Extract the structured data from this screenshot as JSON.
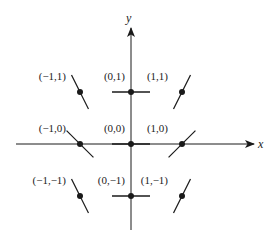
{
  "figure": {
    "colors": {
      "ink": "#1a1a1a",
      "background": "#ffffff"
    },
    "axes": {
      "x_label": "x",
      "y_label": "y",
      "origin_px": [
        131,
        144
      ],
      "unit_px": [
        51,
        52
      ]
    },
    "points": [
      {
        "label": "(−1,1)",
        "x": -1,
        "y": 1,
        "slope": -2
      },
      {
        "label": "(0,1)",
        "x": 0,
        "y": 1,
        "slope": 0
      },
      {
        "label": "(1,1)",
        "x": 1,
        "y": 1,
        "slope": 2
      },
      {
        "label": "(−1,0)",
        "x": -1,
        "y": 0,
        "slope": -1
      },
      {
        "label": "(0,0)",
        "x": 0,
        "y": 0,
        "slope": 0
      },
      {
        "label": "(1,0)",
        "x": 1,
        "y": 0,
        "slope": 1
      },
      {
        "label": "(−1,−1)",
        "x": -1,
        "y": -1,
        "slope": -2
      },
      {
        "label": "(0,−1)",
        "x": 0,
        "y": -1,
        "slope": 0
      },
      {
        "label": "(1,−1)",
        "x": 1,
        "y": -1,
        "slope": 2
      }
    ]
  }
}
